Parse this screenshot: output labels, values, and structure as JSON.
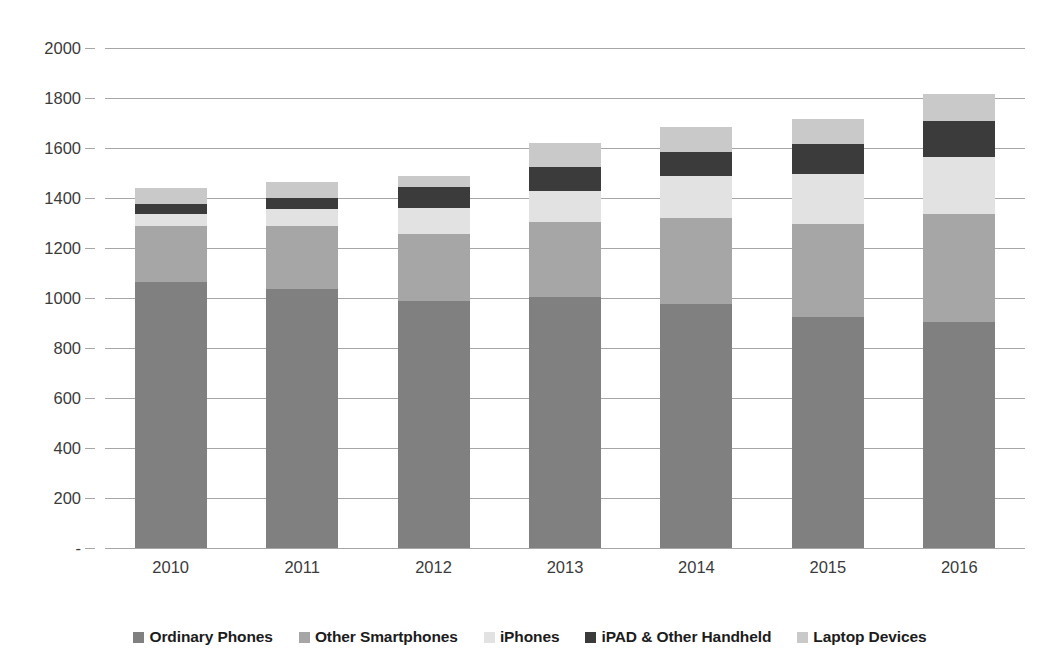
{
  "chart_data": {
    "type": "bar",
    "subtype": "stacked-bar",
    "title": "",
    "xlabel": "",
    "ylabel": "",
    "categories": [
      "2010",
      "2011",
      "2012",
      "2013",
      "2014",
      "2015",
      "2016"
    ],
    "ylim": [
      0,
      2000
    ],
    "ytick_values": [
      0,
      200,
      400,
      600,
      800,
      1000,
      1200,
      1400,
      1600,
      1800,
      2000
    ],
    "ytick_labels": [
      "-",
      "200",
      "400",
      "600",
      "800",
      "1000",
      "1200",
      "1400",
      "1600",
      "1800",
      "2000"
    ],
    "grid": true,
    "legend_position": "bottom",
    "series": [
      {
        "name": "Ordinary Phones",
        "color": "#808080",
        "values": [
          1065,
          1035,
          990,
          1005,
          975,
          925,
          905
        ]
      },
      {
        "name": "Other Smartphones",
        "color": "#a6a6a6",
        "values": [
          225,
          255,
          265,
          300,
          345,
          370,
          430
        ]
      },
      {
        "name": "iPhones",
        "color": "#e2e2e2",
        "values": [
          45,
          65,
          105,
          125,
          170,
          200,
          230
        ]
      },
      {
        "name": "iPAD & Other Handheld",
        "color": "#3b3b3b",
        "values": [
          40,
          45,
          85,
          95,
          95,
          120,
          145
        ]
      },
      {
        "name": "Laptop Devices",
        "color": "#c9c9c9",
        "values": [
          65,
          65,
          45,
          95,
          100,
          100,
          105
        ]
      }
    ],
    "totals": [
      1440,
      1465,
      1490,
      1620,
      1685,
      1715,
      1815
    ]
  },
  "legend": {
    "items": [
      {
        "label": "Ordinary Phones",
        "color": "#808080"
      },
      {
        "label": "Other Smartphones",
        "color": "#a6a6a6"
      },
      {
        "label": "iPhones",
        "color": "#e2e2e2"
      },
      {
        "label": "iPAD & Other Handheld",
        "color": "#3b3b3b"
      },
      {
        "label": "Laptop Devices",
        "color": "#c9c9c9"
      }
    ]
  },
  "axes": {
    "gridline_color": "#a6a6a6",
    "tick_text_color": "#3b3b3b"
  },
  "background": "#ffffff"
}
